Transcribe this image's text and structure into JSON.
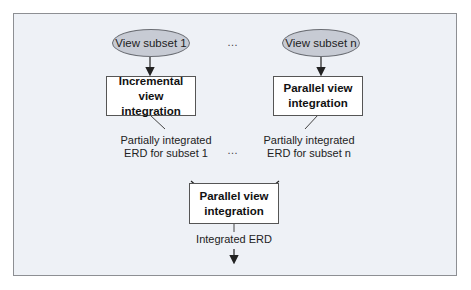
{
  "diagram": {
    "nodes": {
      "view_subset_1": "View subset 1",
      "view_subset_n": "View subset n",
      "incremental_integration": [
        "Incremental view",
        "integration"
      ],
      "parallel_integration_top": [
        "Parallel view",
        "integration"
      ],
      "parallel_integration_bottom": [
        "Parallel view",
        "integration"
      ]
    },
    "labels": {
      "partial_1": [
        "Partially integrated",
        "ERD for subset 1"
      ],
      "partial_n": [
        "Partially integrated",
        "ERD for subset n"
      ],
      "integrated": "Integrated ERD"
    },
    "ellipsis": "…",
    "colors": {
      "frame_bg": "#eef1f6",
      "ellipse_fill": "#c7cbd4",
      "box_fill": "#ffffff",
      "line": "#222222"
    },
    "edges": [
      {
        "from": "view_subset_1",
        "to": "incremental_integration"
      },
      {
        "from": "view_subset_n",
        "to": "parallel_integration_top"
      },
      {
        "from": "incremental_integration",
        "to": "partial_1"
      },
      {
        "from": "parallel_integration_top",
        "to": "partial_n"
      },
      {
        "from": "partial_1",
        "to": "parallel_integration_bottom"
      },
      {
        "from": "partial_n",
        "to": "parallel_integration_bottom"
      },
      {
        "from": "parallel_integration_bottom",
        "to": "integrated"
      }
    ]
  }
}
